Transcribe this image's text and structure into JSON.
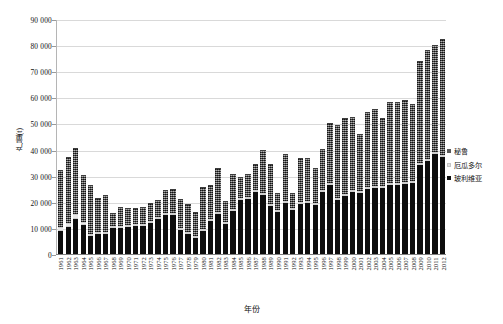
{
  "chart_data": {
    "type": "bar",
    "stacked": true,
    "title": "",
    "xlabel": "年份",
    "ylabel": "产量(t)",
    "ylim": [
      0,
      90000
    ],
    "ytick_step": 10000,
    "grid": true,
    "legend_position": "right",
    "ytick_labels": [
      "90 000",
      "80 000",
      "70 000",
      "60 000",
      "50 000",
      "40 000",
      "30 000",
      "20 000",
      "10 000",
      "0"
    ],
    "ytick_values": [
      90000,
      80000,
      70000,
      60000,
      50000,
      40000,
      30000,
      20000,
      10000,
      0
    ],
    "categories": [
      "1961",
      "1962",
      "1963",
      "1964",
      "1965",
      "1966",
      "1967",
      "1968",
      "1969",
      "1970",
      "1971",
      "1972",
      "1973",
      "1974",
      "1975",
      "1976",
      "1977",
      "1978",
      "1979",
      "1980",
      "1981",
      "1982",
      "1983",
      "1984",
      "1985",
      "1986",
      "1987",
      "1988",
      "1989",
      "1990",
      "1991",
      "1992",
      "1993",
      "1994",
      "1995",
      "1996",
      "1997",
      "1998",
      "1999",
      "2000",
      "2001",
      "2002",
      "2003",
      "2004",
      "2005",
      "2006",
      "2007",
      "2008",
      "2009",
      "2010",
      "2011",
      "2012"
    ],
    "series": [
      {
        "name": "玻利维亚",
        "color": "#0d0d0d",
        "values": [
          9000,
          10400,
          13500,
          11300,
          7000,
          7800,
          7500,
          9800,
          10000,
          10200,
          10600,
          10800,
          11700,
          13300,
          15000,
          15000,
          9300,
          7700,
          6100,
          8800,
          12700,
          15400,
          11500,
          16300,
          20600,
          20900,
          23700,
          22500,
          18200,
          16000,
          19700,
          16800,
          19000,
          19600,
          18800,
          23600,
          26300,
          20500,
          22200,
          23900,
          23300,
          25000,
          25200,
          25400,
          26500,
          26600,
          26900,
          27100,
          34200,
          35700,
          38300,
          37300
        ]
      },
      {
        "name": "厄瓜多尔",
        "color": "#e8e8e8",
        "values": [
          1400,
          1300,
          1700,
          900,
          600,
          600,
          600,
          700,
          600,
          600,
          600,
          600,
          700,
          700,
          800,
          800,
          700,
          700,
          600,
          700,
          700,
          700,
          600,
          700,
          700,
          700,
          700,
          700,
          700,
          700,
          700,
          700,
          700,
          700,
          700,
          700,
          700,
          700,
          700,
          700,
          700,
          700,
          700,
          700,
          700,
          700,
          700,
          700,
          700,
          700,
          700,
          700
        ]
      },
      {
        "name": "秘鲁",
        "color": "#5a5a5a",
        "values": [
          21700,
          25300,
          25400,
          17900,
          18500,
          13000,
          14300,
          5100,
          7100,
          6600,
          6300,
          6400,
          7100,
          6600,
          8600,
          9200,
          11100,
          10700,
          9400,
          16200,
          12800,
          16600,
          8200,
          13700,
          8000,
          9000,
          9900,
          16400,
          15700,
          6500,
          18000,
          5700,
          17100,
          16400,
          13500,
          15800,
          23300,
          28200,
          29000,
          27900,
          21900,
          28700,
          29500,
          26000,
          31000,
          30900,
          31300,
          29600,
          39100,
          41800,
          41100,
          44400
        ]
      }
    ]
  },
  "legend": {
    "items": [
      {
        "label": "秘鲁"
      },
      {
        "label": "厄瓜多尔"
      },
      {
        "label": "玻利维亚"
      }
    ]
  }
}
